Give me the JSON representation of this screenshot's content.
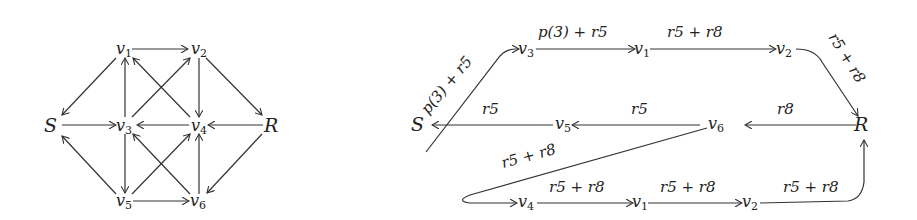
{
  "left_graph": {
    "nodes": [
      {
        "id": "S",
        "label": "S",
        "x": 54,
        "y": 128
      },
      {
        "id": "v1",
        "label": "v1",
        "x": 122,
        "y": 50
      },
      {
        "id": "v2",
        "label": "v2",
        "x": 197,
        "y": 50
      },
      {
        "id": "v3",
        "label": "v3",
        "x": 122,
        "y": 128
      },
      {
        "id": "v4",
        "label": "v4",
        "x": 197,
        "y": 128
      },
      {
        "id": "R",
        "label": "R",
        "x": 271,
        "y": 128
      },
      {
        "id": "v5",
        "label": "v5",
        "x": 122,
        "y": 206
      },
      {
        "id": "v6",
        "label": "v6",
        "x": 197,
        "y": 206
      }
    ],
    "edges": [
      {
        "from": "v1",
        "to": "v2"
      },
      {
        "from": "v1",
        "to": "S"
      },
      {
        "from": "v2",
        "to": "R"
      },
      {
        "from": "v2",
        "to": "v4"
      },
      {
        "from": "v3",
        "to": "v1"
      },
      {
        "from": "v3",
        "to": "v2"
      },
      {
        "from": "v4",
        "to": "v1"
      },
      {
        "from": "S",
        "to": "v3"
      },
      {
        "from": "v4",
        "to": "v3"
      },
      {
        "from": "R",
        "to": "v4"
      },
      {
        "from": "v3",
        "to": "v5"
      },
      {
        "from": "v5",
        "to": "v4"
      },
      {
        "from": "v6",
        "to": "v3"
      },
      {
        "from": "v6",
        "to": "v4"
      },
      {
        "from": "v5",
        "to": "S"
      },
      {
        "from": "R",
        "to": "v6"
      },
      {
        "from": "v5",
        "to": "v6"
      }
    ]
  },
  "right_graph": {
    "nodes": {
      "S": "S",
      "R": "R",
      "top_v3": "v3",
      "top_v1": "v1",
      "top_v2": "v2",
      "mid_v5": "v5",
      "mid_v6": "v6",
      "bot_v4": "v4",
      "bot_v1": "v1",
      "bot_v2": "v2"
    },
    "edge_labels": {
      "s_to_v3": "p(3) + r5",
      "v3_to_v1": "p(3) + r5",
      "v1_to_v2": "r5 + r8",
      "v2_to_R": "r5 + r8",
      "v5_to_S": "r5",
      "v6_to_v5": "r5",
      "R_to_v6": "r8",
      "v6_to_v4": "r5 + r8",
      "v4_to_v1": "r5 + r8"
    }
  }
}
